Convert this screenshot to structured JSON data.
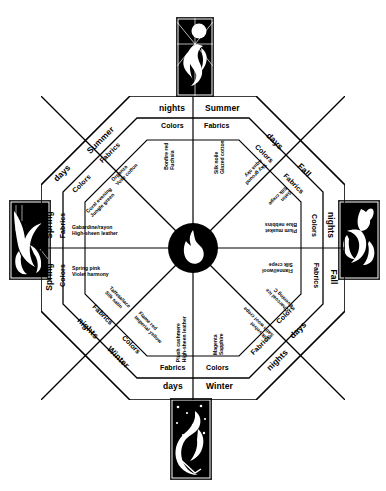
{
  "diagram": {
    "center_icon": "flame-icon",
    "shape": "octagon",
    "cardinal_labels": {
      "top_left": "nights",
      "top_right": "Summer",
      "bottom_left": "days",
      "bottom_right": "Winter",
      "left_upper": "Spring",
      "left_lower": "Spring",
      "right_upper": "nights",
      "right_lower": "Fall"
    },
    "diagonal_labels": {
      "upper_left_outer": "Summer",
      "upper_left_inner": "days",
      "upper_right_outer": "days",
      "upper_right_inner": "Fall",
      "lower_left_outer": "nights",
      "lower_left_inner": "Winter",
      "lower_right_outer": "days",
      "lower_right_inner": "nights"
    },
    "sectors": [
      {
        "id": "summer-nights-colors",
        "season": "Summer",
        "time": "nights",
        "category": "Colors",
        "items": [
          "Bonfire red",
          "Fuchsia"
        ]
      },
      {
        "id": "summer-nights-fabrics",
        "season": "Summer",
        "time": "nights",
        "category": "Fabrics",
        "items": [
          "Silk noile",
          "Glazed cotton"
        ]
      },
      {
        "id": "summer-days-fabrics",
        "season": "Summer",
        "time": "days",
        "category": "Fabrics",
        "items": [
          "Organza",
          "Voile cotton"
        ]
      },
      {
        "id": "spring-days-colors",
        "season": "Spring",
        "time": "days",
        "category": "Colors",
        "items": [
          "Coral evening",
          "Jungle green"
        ]
      },
      {
        "id": "spring-days-fabrics",
        "season": "Spring",
        "time": "days",
        "category": "Fabrics",
        "items": [
          "Gabardine/rayon",
          "High-sheen leather"
        ]
      },
      {
        "id": "spring-nights-colors",
        "season": "Spring",
        "time": "nights",
        "category": "Colors",
        "items": [
          "Spring pink",
          "Violet harmony"
        ]
      },
      {
        "id": "spring-nights-fabrics",
        "season": "Spring",
        "time": "nights",
        "category": "Fabrics",
        "items": [
          "Taffeta/lace",
          "Silk satin"
        ]
      },
      {
        "id": "winter-nights-colors",
        "season": "Winter",
        "time": "nights",
        "category": "Colors",
        "items": [
          "Flame red",
          "Imperial yellow"
        ]
      },
      {
        "id": "winter-days-fabrics",
        "season": "Winter",
        "time": "days",
        "category": "Fabrics",
        "items": [
          "Plush cashmere",
          "High-sheen leather"
        ]
      },
      {
        "id": "winter-days-colors",
        "season": "Winter",
        "time": "days",
        "category": "Colors",
        "items": [
          "Magenta",
          "Sapphire"
        ]
      },
      {
        "id": "winter-nights-fabrics",
        "season": "Winter",
        "time": "nights",
        "category": "Fabrics",
        "items": [
          "Silk velvet",
          "Satin wool crepe"
        ]
      },
      {
        "id": "fall-days-colors",
        "season": "Fall",
        "time": "days",
        "category": "Colors",
        "items": [
          "Charcoal ice",
          "Evening C"
        ]
      },
      {
        "id": "fall-days-fabrics",
        "season": "Fall",
        "time": "days",
        "category": "Fabrics",
        "items": [
          "Flannel/wool",
          "Silk crepe"
        ]
      },
      {
        "id": "fall-nights-colors",
        "season": "Fall",
        "time": "nights",
        "category": "Colors",
        "items": [
          "Plum musket",
          "Blue nebbins"
        ]
      },
      {
        "id": "fall-nights-fabrics",
        "season": "Fall",
        "time": "nights",
        "category": "Fabrics",
        "items": [
          "Satin",
          "Silk crepe"
        ]
      },
      {
        "id": "summer-days-colors",
        "season": "Summer",
        "time": "days",
        "category": "Colors",
        "items": [
          "Sky ground",
          "Aqua sky"
        ]
      }
    ],
    "category_labels": {
      "colors": "Colors",
      "fabrics": "Fabrics"
    },
    "illustrations": [
      {
        "id": "panel-top",
        "position": "top",
        "name": "summer-sun-bird-illustration"
      },
      {
        "id": "panel-left",
        "position": "left",
        "name": "spring-leaf-bird-illustration"
      },
      {
        "id": "panel-right",
        "position": "right",
        "name": "fall-harvest-bird-illustration"
      },
      {
        "id": "panel-bottom",
        "position": "bottom",
        "name": "winter-night-bird-illustration"
      }
    ],
    "colors": {
      "ink": "#000000",
      "paper": "#ffffff"
    }
  }
}
